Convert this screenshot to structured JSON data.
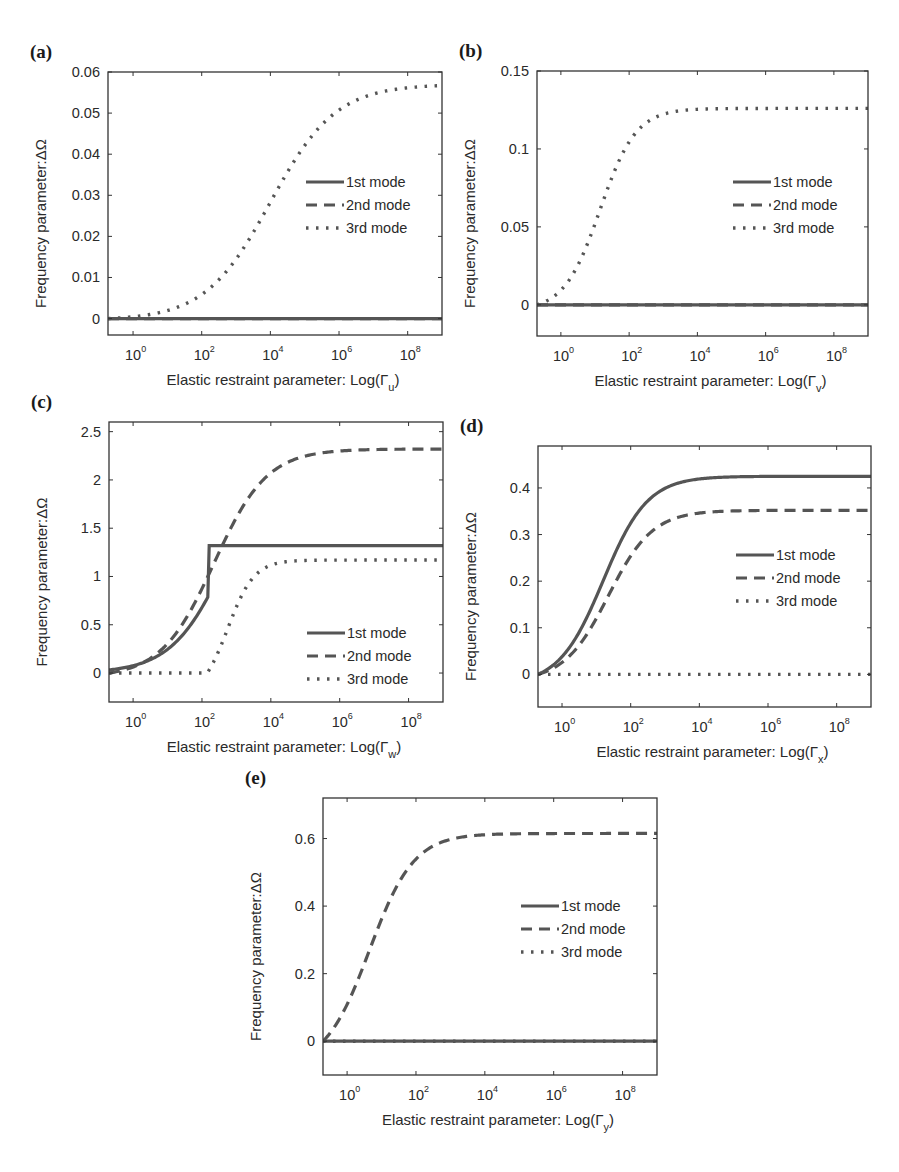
{
  "figure": {
    "ylabel": "Frequency parameter:ΔΩ",
    "xlabel_prefix": "Elastic restraint parameter: Log(Γ",
    "xlabel_suffix": ")",
    "legend": [
      "1st mode",
      "2nd mode",
      "3rd mode"
    ],
    "line_color": "#555555",
    "axis_color": "#333333"
  },
  "chart_data": [
    {
      "type": "line",
      "panel": "(a)",
      "title": "",
      "xlabel": "Elastic restraint parameter: Log(Γu)",
      "xlabel_subscript": "u",
      "ylabel": "Frequency parameter:ΔΩ",
      "xscale": "log",
      "xlim_log10": [
        -0.73,
        9.0
      ],
      "ylim": [
        -0.004,
        0.06
      ],
      "xticks": [
        "10^0",
        "10^2",
        "10^4",
        "10^6",
        "10^8"
      ],
      "yticks": [
        0,
        0.01,
        0.02,
        0.03,
        0.04,
        0.05,
        0.06
      ],
      "ytick_labels": [
        "0",
        "0.01",
        "0.02",
        "0.03",
        "0.04",
        "0.05",
        "0.06"
      ],
      "legend_position": "center right",
      "box": {
        "x0": 108,
        "y0": 72,
        "x1": 442,
        "y1": 335
      },
      "legend_box": {
        "x": 306,
        "y": 182
      },
      "series": [
        {
          "name": "1st mode",
          "style": "solid",
          "plateau": 0.0,
          "center_log10": 4.0,
          "steepness": 1.0
        },
        {
          "name": "2nd mode",
          "style": "dashed",
          "plateau": 0.0,
          "center_log10": 4.0,
          "steepness": 1.0
        },
        {
          "name": "3rd mode",
          "style": "dotted",
          "plateau": 0.057,
          "center_log10": 4.0,
          "steepness": 1.05
        }
      ]
    },
    {
      "type": "line",
      "panel": "(b)",
      "title": "",
      "xlabel": "Elastic restraint parameter: Log(Γv)",
      "xlabel_subscript": "v",
      "ylabel": "Frequency parameter:ΔΩ",
      "xscale": "log",
      "xlim_log10": [
        -0.7,
        9.0
      ],
      "ylim": [
        -0.02,
        0.15
      ],
      "xticks": [
        "10^0",
        "10^2",
        "10^4",
        "10^6",
        "10^8"
      ],
      "yticks": [
        0,
        0.05,
        0.1,
        0.15
      ],
      "ytick_labels": [
        "0",
        "0.05",
        "0.1",
        "0.15"
      ],
      "legend_position": "center right",
      "box": {
        "x0": 537,
        "y0": 71,
        "x1": 868,
        "y1": 336
      },
      "legend_box": {
        "x": 733,
        "y": 182
      },
      "series": [
        {
          "name": "1st mode",
          "style": "solid",
          "plateau": 0.0,
          "center_log10": 1.0,
          "steepness": 1.0
        },
        {
          "name": "2nd mode",
          "style": "dashed",
          "plateau": 0.0,
          "center_log10": 1.0,
          "steepness": 1.0
        },
        {
          "name": "3rd mode",
          "style": "dotted",
          "plateau": 0.126,
          "center_log10": 1.15,
          "steepness": 1.9
        }
      ]
    },
    {
      "type": "line",
      "panel": "(c)",
      "title": "",
      "xlabel": "Elastic restraint parameter: Log(Γw)",
      "xlabel_subscript": "w",
      "ylabel": "Frequency parameter:ΔΩ",
      "xscale": "log",
      "xlim_log10": [
        -0.7,
        9.0
      ],
      "ylim": [
        -0.3,
        2.6
      ],
      "xticks": [
        "10^0",
        "10^2",
        "10^4",
        "10^6",
        "10^8"
      ],
      "yticks": [
        0,
        0.5,
        1,
        1.5,
        2,
        2.5
      ],
      "ytick_labels": [
        "0",
        "0.5",
        "1",
        "1.5",
        "2",
        "2.5"
      ],
      "legend_position": "lower right",
      "box": {
        "x0": 109,
        "y0": 422,
        "x1": 443,
        "y1": 702
      },
      "legend_box": {
        "x": 307,
        "y": 633
      },
      "series": [
        {
          "name": "1st mode",
          "style": "solid",
          "plateau": 1.32,
          "center_log10": 2.0,
          "steepness": 1.25,
          "cap_at_log10": 2.2,
          "shape": "capped"
        },
        {
          "name": "2nd mode",
          "style": "dashed",
          "plateau": 2.32,
          "center_log10": 2.35,
          "steepness": 1.3
        },
        {
          "name": "3rd mode",
          "style": "dotted",
          "plateau": 1.17,
          "center_log10": 2.75,
          "steepness": 2.6,
          "onset_log10": 2.15
        }
      ]
    },
    {
      "type": "line",
      "panel": "(d)",
      "title": "",
      "xlabel": "Elastic restraint parameter: Log(Γx)",
      "xlabel_subscript": "x",
      "ylabel": "Frequency parameter:ΔΩ",
      "xscale": "log",
      "xlim_log10": [
        -0.7,
        9.0
      ],
      "ylim": [
        -0.07,
        0.49
      ],
      "xticks": [
        "10^0",
        "10^2",
        "10^4",
        "10^6",
        "10^8"
      ],
      "yticks": [
        0,
        0.1,
        0.2,
        0.3,
        0.4
      ],
      "ytick_labels": [
        "0",
        "0.1",
        "0.2",
        "0.3",
        "0.4"
      ],
      "legend_position": "center right",
      "box": {
        "x0": 538,
        "y0": 446,
        "x1": 871,
        "y1": 707
      },
      "legend_box": {
        "x": 736,
        "y": 555
      },
      "series": [
        {
          "name": "1st mode",
          "style": "solid",
          "plateau": 0.425,
          "center_log10": 1.2,
          "steepness": 1.55
        },
        {
          "name": "2nd mode",
          "style": "dashed",
          "plateau": 0.352,
          "center_log10": 1.35,
          "steepness": 1.55
        },
        {
          "name": "3rd mode",
          "style": "dotted",
          "plateau": 0.0,
          "center_log10": 1.0,
          "steepness": 1.0
        }
      ]
    },
    {
      "type": "line",
      "panel": "(e)",
      "title": "",
      "xlabel": "Elastic restraint parameter: Log(Γy)",
      "xlabel_subscript": "y",
      "ylabel": "Frequency parameter:ΔΩ",
      "xscale": "log",
      "xlim_log10": [
        -0.7,
        9.0
      ],
      "ylim": [
        -0.1,
        0.72
      ],
      "xticks": [
        "10^0",
        "10^2",
        "10^4",
        "10^6",
        "10^8"
      ],
      "yticks": [
        0,
        0.2,
        0.4,
        0.6
      ],
      "ytick_labels": [
        "0",
        "0.2",
        "0.4",
        "0.6"
      ],
      "legend_position": "center right",
      "box": {
        "x0": 323,
        "y0": 798,
        "x1": 657,
        "y1": 1075
      },
      "legend_box": {
        "x": 521,
        "y": 906
      },
      "series": [
        {
          "name": "1st mode",
          "style": "solid",
          "plateau": 0.0,
          "center_log10": 0.6,
          "steepness": 1.0
        },
        {
          "name": "2nd mode",
          "style": "dashed",
          "plateau": 0.615,
          "center_log10": 0.65,
          "steepness": 1.55
        },
        {
          "name": "3rd mode",
          "style": "dotted",
          "plateau": 0.0,
          "center_log10": 0.6,
          "steepness": 1.0
        }
      ]
    }
  ]
}
